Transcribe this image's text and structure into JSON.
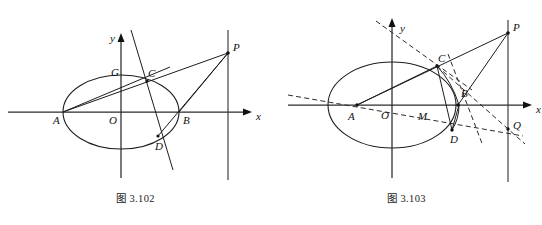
{
  "page": {
    "background": "#ffffff",
    "ink": "#111111",
    "width": 542,
    "height": 225
  },
  "figures": [
    {
      "id": "fig-3-102",
      "caption": "图 3.102",
      "axes": {
        "x_label": "x",
        "y_label": "y",
        "origin_label": "O",
        "origin": [
          121,
          112
        ],
        "x_axis": {
          "x1": 8,
          "y1": 112,
          "x2": 252,
          "y2": 112
        },
        "y_axis": {
          "x1": 121,
          "y1": 178,
          "x2": 121,
          "y2": 33
        }
      },
      "ellipse": {
        "cx": 121,
        "cy": 112,
        "rx": 58,
        "ry": 37
      },
      "directrix": {
        "x": 228,
        "y_top": 30,
        "y_bottom": 180
      },
      "points": [
        {
          "name": "A",
          "x": 63,
          "y": 112,
          "label_dx": -10,
          "label_dy": 12,
          "marker": false
        },
        {
          "name": "O",
          "x": 121,
          "y": 112,
          "label_dx": -12,
          "label_dy": 12,
          "marker": false
        },
        {
          "name": "B",
          "x": 179,
          "y": 112,
          "label_dx": 4,
          "label_dy": 12,
          "marker": false
        },
        {
          "name": "C",
          "x": 147,
          "y": 81,
          "label_dx": 1,
          "label_dy": -4,
          "marker": true
        },
        {
          "name": "D",
          "x": 158,
          "y": 136,
          "label_dx": -3,
          "label_dy": 14,
          "marker": true
        },
        {
          "name": "G",
          "x": 124,
          "y": 80,
          "label_dx": -13,
          "label_dy": -4,
          "marker": false
        },
        {
          "name": "P",
          "x": 228,
          "y": 53,
          "label_dx": 5,
          "label_dy": -2,
          "marker": true
        }
      ],
      "segments": [
        {
          "name": "A-P",
          "from": [
            63,
            112
          ],
          "to": [
            228,
            53
          ]
        },
        {
          "name": "A-C-ext",
          "from": [
            63,
            112
          ],
          "to": [
            168,
            68
          ]
        },
        {
          "name": "B-P",
          "from": [
            179,
            112
          ],
          "to": [
            228,
            53
          ]
        },
        {
          "name": "D-P",
          "from": [
            158,
            136
          ],
          "to": [
            228,
            53
          ]
        },
        {
          "name": "CD-line",
          "from": [
            131,
            30
          ],
          "to": [
            173,
            170
          ]
        }
      ],
      "dashed_segments": []
    },
    {
      "id": "fig-3-103",
      "caption": "图 3.103",
      "axes": {
        "x_label": "x",
        "y_label": "y",
        "origin_label": "O",
        "origin": [
          392,
          105
        ],
        "x_axis": {
          "x1": 288,
          "y1": 105,
          "x2": 532,
          "y2": 105
        },
        "y_axis": {
          "x1": 392,
          "y1": 178,
          "x2": 392,
          "y2": 18
        }
      },
      "ellipse": {
        "cx": 392,
        "cy": 105,
        "rx": 64,
        "ry": 43
      },
      "directrix": {
        "x": 508,
        "y_top": 20,
        "y_bottom": 182
      },
      "points": [
        {
          "name": "A",
          "x": 357,
          "y": 105,
          "label_dx": -10,
          "label_dy": 13,
          "marker": true
        },
        {
          "name": "O",
          "x": 392,
          "y": 105,
          "label_dx": -12,
          "label_dy": 13,
          "marker": false
        },
        {
          "name": "M",
          "x": 423,
          "y": 105,
          "label_dx": -4,
          "label_dy": 13,
          "marker": false
        },
        {
          "name": "B",
          "x": 458,
          "y": 105,
          "label_dx": 3,
          "label_dy": -8,
          "marker": true
        },
        {
          "name": "C",
          "x": 437,
          "y": 66,
          "label_dx": 1,
          "label_dy": -4,
          "marker": true
        },
        {
          "name": "D",
          "x": 452,
          "y": 129,
          "label_dx": -2,
          "label_dy": 14,
          "marker": true
        },
        {
          "name": "P",
          "x": 508,
          "y": 33,
          "label_dx": 5,
          "label_dy": -2,
          "marker": true
        },
        {
          "name": "Q",
          "x": 508,
          "y": 129,
          "label_dx": 5,
          "label_dy": 0,
          "marker": true
        }
      ],
      "segments": [
        {
          "name": "A-P",
          "from": [
            357,
            105
          ],
          "to": [
            508,
            33
          ]
        },
        {
          "name": "A-C",
          "from": [
            357,
            105
          ],
          "to": [
            437,
            66
          ]
        },
        {
          "name": "B-P",
          "from": [
            458,
            105
          ],
          "to": [
            508,
            33
          ]
        },
        {
          "name": "C-D",
          "from": [
            437,
            66
          ],
          "to": [
            452,
            129
          ]
        },
        {
          "name": "D-B",
          "from": [
            452,
            129
          ],
          "to": [
            458,
            105
          ]
        },
        {
          "name": "C-B-curve",
          "from": [
            437,
            66
          ],
          "to": [
            458,
            105
          ]
        }
      ],
      "dashed_segments": [
        {
          "name": "y-slant-through-C",
          "from": [
            378,
            22
          ],
          "to": [
            468,
            86
          ]
        },
        {
          "name": "A-Q-dashed",
          "from": [
            288,
            96
          ],
          "to": [
            520,
            136
          ]
        },
        {
          "name": "C-Q-dashed",
          "from": [
            437,
            66
          ],
          "to": [
            522,
            141
          ]
        },
        {
          "name": "B-D-ext-dashed",
          "from": [
            449,
            56
          ],
          "to": [
            482,
            143
          ]
        }
      ]
    }
  ]
}
